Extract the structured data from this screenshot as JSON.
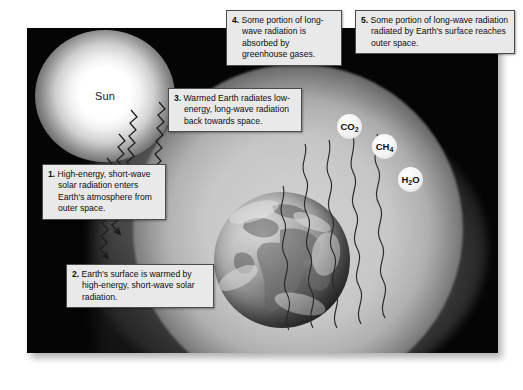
{
  "diagram": {
    "sun": {
      "label": "Sun"
    },
    "earth": {
      "label": "Earth"
    },
    "gases": [
      {
        "id": "co2",
        "formula": "CO",
        "subscript": "2"
      },
      {
        "id": "ch4",
        "formula": "CH",
        "subscript": "4"
      },
      {
        "id": "h2o",
        "formula": "H",
        "subscript": "2",
        "suffix": "O"
      }
    ],
    "callouts": [
      {
        "id": "callout-1",
        "number": "1.",
        "text": "High-energy, short-wave solar radiation enters Earth's atmosphere from outer space."
      },
      {
        "id": "callout-2",
        "number": "2.",
        "text": "Earth's surface is warmed by high-energy, short-wave solar radiation."
      },
      {
        "id": "callout-3",
        "number": "3.",
        "text": "Warmed Earth radiates low-energy, long-wave radiation back towards space."
      },
      {
        "id": "callout-4",
        "number": "4.",
        "text": "Some portion of long-wave radiation is absorbed by greenhouse gases."
      },
      {
        "id": "callout-5",
        "number": "5.",
        "text": "Some portion of long-wave radiation radiated by Earth's surface reaches outer space."
      }
    ],
    "colors": {
      "space": "#050505",
      "callout_background": "#e9e9e9",
      "callout_border": "#4a4a4a",
      "text": "#0d0d0d",
      "ray": "#1d1d1d"
    }
  }
}
